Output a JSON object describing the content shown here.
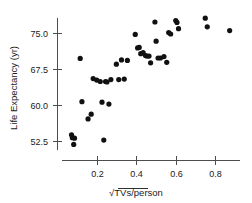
{
  "chart_data": {
    "type": "scatter",
    "title": "",
    "xlabel": "√TVs/person",
    "ylabel": "Life Expectancy (yr)",
    "xlim": [
      0.04,
      0.92
    ],
    "ylim": [
      50.0,
      78.5
    ],
    "xticks": [
      0.2,
      0.4,
      0.6,
      0.8
    ],
    "xtick_labels": [
      "0.2",
      "0.4",
      "0.6",
      "0.8"
    ],
    "yticks": [
      52.5,
      60.0,
      67.5,
      75.0
    ],
    "ytick_labels": [
      "52.5",
      "67.5",
      "60.0",
      "75.0"
    ],
    "ytick_labels_ordered": [
      "75.0",
      "67.5",
      "60.0",
      "52.5"
    ],
    "grid": false,
    "legend": null,
    "marker": "filled-circle",
    "marker_color": "#111111",
    "axis_color": "#4d4d4d",
    "n_points": 44,
    "x": [
      0.068,
      0.072,
      0.079,
      0.083,
      0.112,
      0.121,
      0.152,
      0.168,
      0.178,
      0.196,
      0.214,
      0.223,
      0.232,
      0.241,
      0.248,
      0.258,
      0.268,
      0.296,
      0.308,
      0.322,
      0.336,
      0.352,
      0.392,
      0.404,
      0.412,
      0.42,
      0.432,
      0.444,
      0.452,
      0.462,
      0.47,
      0.492,
      0.498,
      0.508,
      0.52,
      0.538,
      0.552,
      0.562,
      0.572,
      0.598,
      0.604,
      0.612,
      0.748,
      0.758,
      0.872
    ],
    "y": [
      53.9,
      53.3,
      51.9,
      53.2,
      69.8,
      60.8,
      57.2,
      58.2,
      65.6,
      65.3,
      65.0,
      60.7,
      52.8,
      65.0,
      64.9,
      60.3,
      65.4,
      68.6,
      65.4,
      69.5,
      65.5,
      69.4,
      74.8,
      72.0,
      72.1,
      70.8,
      71.0,
      70.4,
      70.3,
      70.3,
      68.9,
      77.4,
      73.4,
      69.9,
      69.9,
      70.2,
      69.0,
      75.2,
      74.9,
      77.7,
      77.3,
      76.0,
      78.2,
      76.4,
      75.6
    ]
  },
  "axes": {
    "x_axis_name": "x-axis",
    "y_axis_name": "y-axis"
  }
}
